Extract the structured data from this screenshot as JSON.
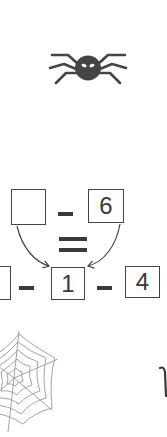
{
  "puzzle": {
    "top_row": {
      "left_box": "",
      "operator": "minus",
      "right_box": "6"
    },
    "equals": "equals",
    "bottom_row": {
      "left_box": "",
      "op1": "minus",
      "middle_box": "1",
      "op2": "minus",
      "right_box": "4"
    }
  },
  "decorations": {
    "spider_icon": "spider-icon",
    "web_icon": "spider-web-icon",
    "thread_icon": "hanging-thread-icon"
  },
  "colors": {
    "ink": "#3a3a3a",
    "box_border": "#444444",
    "web": "#9a9a9a",
    "background": "#ffffff"
  }
}
